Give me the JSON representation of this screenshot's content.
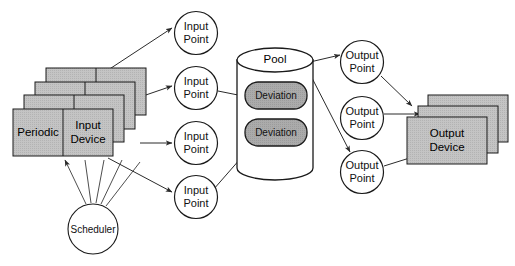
{
  "diagram": {
    "colors": {
      "card_fill": "#c2c2c2",
      "card_fill_back": "#b8b8b8",
      "deviation_fill": "#a8a8a8",
      "cylinder_fill": "#ffffff",
      "stroke": "#1a1a1a",
      "text": "#111111",
      "background": "#ffffff"
    },
    "input_device_stack": {
      "name": "input-device-stack",
      "layers": 4,
      "cells": [
        {
          "label": "Periodic"
        },
        {
          "label_line1": "Input",
          "label_line2": "Device"
        }
      ]
    },
    "scheduler": {
      "label": "Scheduler"
    },
    "input_points": [
      {
        "line1": "Input",
        "line2": "Point"
      },
      {
        "line1": "Input",
        "line2": "Point"
      },
      {
        "line1": "Input",
        "line2": "Point"
      },
      {
        "line1": "Input",
        "line2": "Point"
      }
    ],
    "pool": {
      "label": "Pool",
      "items": [
        {
          "label": "Deviation"
        },
        {
          "label": "Deviation"
        }
      ]
    },
    "output_points": [
      {
        "line1": "Output",
        "line2": "Point"
      },
      {
        "line1": "Output",
        "line2": "Point"
      },
      {
        "line1": "Output",
        "line2": "Point"
      }
    ],
    "output_device_stack": {
      "name": "output-device-stack",
      "layers": 3,
      "label_line1": "Output",
      "label_line2": "Device"
    }
  }
}
